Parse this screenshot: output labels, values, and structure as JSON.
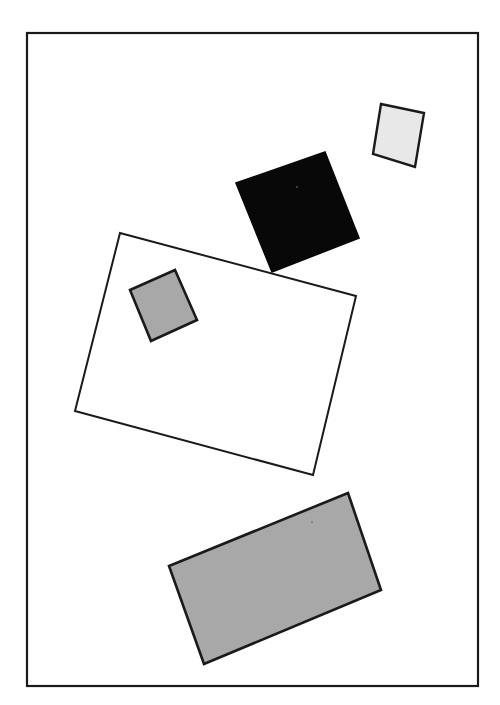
{
  "figure": {
    "canvas": {
      "width": 500,
      "height": 705,
      "background": "#ffffff"
    },
    "frame": {
      "name": "outer-border",
      "x": 27,
      "y": 33,
      "width": 451,
      "height": 653,
      "stroke": "#1a1a1a",
      "stroke_width": 2.2,
      "fill": "none"
    },
    "shapes": [
      {
        "id": "light-square",
        "label": "Small light gray square",
        "role": "rotated-square",
        "fill": "#e8e8e8",
        "stroke": "#1a1a1a",
        "stroke_width": 2.4,
        "points": "381,104 424,113 415,167 373,154"
      },
      {
        "id": "black-square",
        "label": "Black filled square",
        "role": "rotated-square",
        "fill": "#080808",
        "stroke": "#080808",
        "stroke_width": 1.6,
        "points": "325,152 359,238 272,272 236,183"
      },
      {
        "id": "large-outline-rectangle",
        "label": "Large unfilled rectangle outline",
        "role": "rotated-rectangle",
        "fill": "#ffffff",
        "stroke": "#1a1a1a",
        "stroke_width": 2.0,
        "points": "120,233 356,296 313,475 75,411"
      },
      {
        "id": "medium-gray-square",
        "label": "Medium gray square inside outline rectangle",
        "role": "rotated-square",
        "fill": "#a8a8a8",
        "stroke": "#1a1a1a",
        "stroke_width": 2.6,
        "points": "175,270 197,320 151,341 130,290"
      },
      {
        "id": "large-gray-rectangle",
        "label": "Large gray filled rectangle",
        "role": "rotated-rectangle",
        "fill": "#a8a8a8",
        "stroke": "#1a1a1a",
        "stroke_width": 2.6,
        "points": "348,493 381,590 204,664 169,566"
      }
    ],
    "specks": [
      {
        "id": "speck-black-square",
        "cx": 297,
        "cy": 187,
        "r": 0.9,
        "fill": "#555555"
      },
      {
        "id": "speck-gray-rectangle",
        "cx": 312,
        "cy": 522,
        "r": 0.9,
        "fill": "#777777"
      }
    ]
  }
}
